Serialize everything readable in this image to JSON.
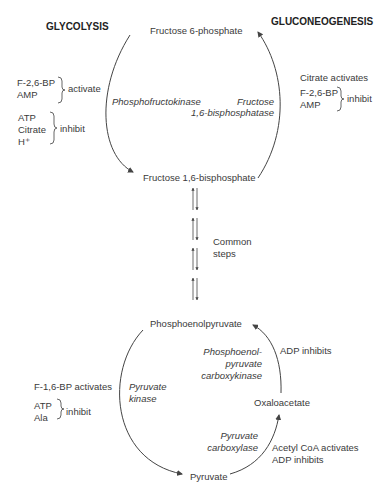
{
  "headers": {
    "left": "GLYCOLYSIS",
    "right": "GLUCONEOGENESIS"
  },
  "metabolites": {
    "f6p": "Fructose 6-phosphate",
    "f16bp": "Fructose 1,6-bisphosphate",
    "pep": "Phosphoenolpyruvate",
    "oaa": "Oxaloacetate",
    "pyruvate": "Pyruvate"
  },
  "enzymes": {
    "pfk": "Phosphofructokinase",
    "fbpase_1": "Fructose",
    "fbpase_2": "1,6-bisphosphatase",
    "pk_1": "Pyruvate",
    "pk_2": "kinase",
    "pepck_1": "Phosphoenol-",
    "pepck_2": "pyruvate",
    "pepck_3": "carboxykinase",
    "pc_1": "Pyruvate",
    "pc_2": "carboxylase"
  },
  "common_steps": {
    "line1": "Common",
    "line2": "steps"
  },
  "regulation": {
    "pfk_activators": [
      "F-2,6-BP",
      "AMP"
    ],
    "pfk_activate_label": "activate",
    "pfk_inhibitors": [
      "ATP",
      "Citrate",
      "H⁺"
    ],
    "pfk_inhibit_label": "inhibit",
    "fbpase_activator": "Citrate activates",
    "fbpase_inhibitors": [
      "F-2,6-BP",
      "AMP"
    ],
    "fbpase_inhibit_label": "inhibit",
    "pk_activator": "F-1,6-BP activates",
    "pk_inhibitors": [
      "ATP",
      "Ala"
    ],
    "pk_inhibit_label": "inhibit",
    "pepck_inhibitor": "ADP inhibits",
    "pc_activator": "Acetyl CoA activates",
    "pc_inhibitor": "ADP inhibits"
  },
  "colors": {
    "line": "#444444",
    "text": "#3a3a3a"
  }
}
